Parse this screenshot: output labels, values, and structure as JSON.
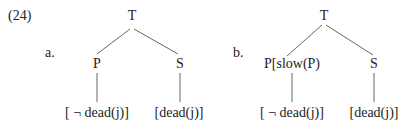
{
  "example_number": "(24)",
  "trees": [
    {
      "label": "a.",
      "root": "T",
      "left_node": "P",
      "right_node": "S",
      "left_leaf": "[ ¬ dead(j)]",
      "right_leaf": "[dead(j)]"
    },
    {
      "label": "b.",
      "root": "T",
      "left_node": "P[slow(P)",
      "right_node": "S",
      "left_leaf": "[ ¬ dead(j)]",
      "right_leaf": "[dead(j)]"
    }
  ]
}
